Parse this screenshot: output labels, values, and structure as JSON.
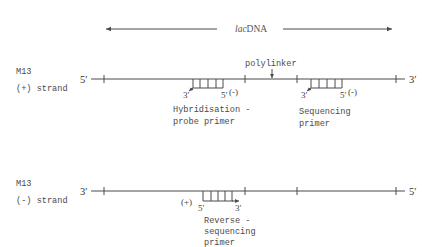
{
  "diagram": {
    "region_label": {
      "italic": "lac",
      "rest": "DNA"
    },
    "polylinker_label": "polylinker",
    "top_strand": {
      "name_line1": "M13",
      "name_line2": "(+) strand",
      "left_end": "5′",
      "right_end": "3′",
      "primers": [
        {
          "name": "hybridisation-probe-primer",
          "label_line1": "Hybridisation -",
          "label_line2": "probe primer",
          "left_end": "3′",
          "right_end": "5′",
          "polarity": "(-)"
        },
        {
          "name": "sequencing-primer",
          "label_line1": "Sequencing",
          "label_line2": "primer",
          "left_end": "3′",
          "right_end": "5′",
          "polarity": "(-)"
        }
      ]
    },
    "bottom_strand": {
      "name_line1": "M13",
      "name_line2": "(-) strand",
      "left_end": "3′",
      "right_end": "5′",
      "primers": [
        {
          "name": "reverse-sequencing-primer",
          "label_line1": "Reverse -",
          "label_line2": "sequencing",
          "label_line3": "primer",
          "left_end": "5′",
          "right_end": "3′",
          "polarity": "(+)"
        }
      ]
    }
  }
}
